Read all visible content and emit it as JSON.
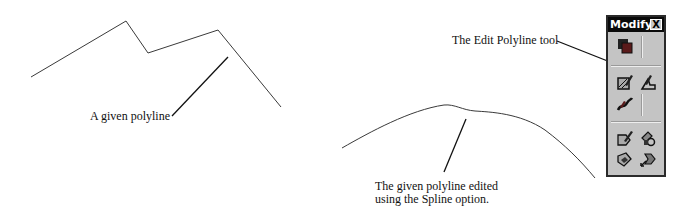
{
  "labels": {
    "given_polyline": "A given polyline",
    "edit_polyline_tool": "The Edit Polyline tool",
    "spline_caption_line1": "The given polyline edited",
    "spline_caption_line2": "using the Spline option."
  },
  "toolbar": {
    "title": "Modify",
    "close_label": "X",
    "icons": [
      {
        "name": "properties-icon"
      },
      {
        "name": "edit-hatch-icon"
      },
      {
        "name": "edit-polyline-icon"
      },
      {
        "name": "edit-spline-icon"
      },
      {
        "name": "edit-attribute-icon"
      },
      {
        "name": "block-attribute-manager-icon"
      },
      {
        "name": "sync-attributes-icon"
      },
      {
        "name": "attribute-extract-icon"
      }
    ]
  },
  "drawing": {
    "polyline_points": "31,77 126,21 148,53 218,30 281,107",
    "spline_path": "M342,148 C370,132 410,110 444,105 C455,104 462,110 475,111 C490,112 520,113 545,130 C565,145 580,160 595,178",
    "colors": {
      "line": "#333333",
      "toolbar_bg": "#c4c4c4",
      "title_bg": "#0a0a0a"
    }
  }
}
